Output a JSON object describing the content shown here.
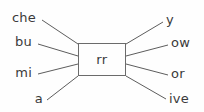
{
  "diagram": {
    "stem": {
      "text": "rr",
      "box": {
        "x": 78,
        "y": 43,
        "width": 48,
        "height": 33
      }
    },
    "prefixes": [
      {
        "text": "che",
        "x": 36,
        "y": 24,
        "line": {
          "x1": 42,
          "y1": 20,
          "x2": 78,
          "y2": 44
        }
      },
      {
        "text": "bu",
        "x": 32,
        "y": 48,
        "line": {
          "x1": 38,
          "y1": 44,
          "x2": 78,
          "y2": 56
        }
      },
      {
        "text": "mi",
        "x": 32,
        "y": 79,
        "line": {
          "x1": 38,
          "y1": 74,
          "x2": 78,
          "y2": 64
        }
      },
      {
        "text": "a",
        "x": 43,
        "y": 105,
        "line": {
          "x1": 47,
          "y1": 100,
          "x2": 78,
          "y2": 76
        }
      }
    ],
    "suffixes": [
      {
        "text": "y",
        "x": 166,
        "y": 26,
        "line": {
          "x1": 126,
          "y1": 44,
          "x2": 163,
          "y2": 22
        }
      },
      {
        "text": "ow",
        "x": 171,
        "y": 49,
        "line": {
          "x1": 126,
          "y1": 56,
          "x2": 168,
          "y2": 45
        }
      },
      {
        "text": "or",
        "x": 171,
        "y": 80,
        "line": {
          "x1": 126,
          "y1": 64,
          "x2": 168,
          "y2": 75
        }
      },
      {
        "text": "ive",
        "x": 169,
        "y": 105,
        "line": {
          "x1": 126,
          "y1": 76,
          "x2": 166,
          "y2": 99
        }
      }
    ],
    "colors": {
      "stroke": "#5d5d5d",
      "text": "#3a3a3a",
      "background": "#fefefe",
      "box_border": "#6b6b6b"
    }
  }
}
